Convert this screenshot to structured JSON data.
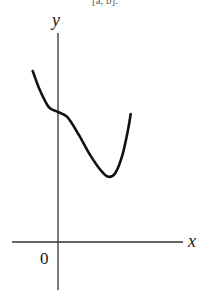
{
  "figure": {
    "top_fragment": "[a, b].",
    "axes": {
      "x_label": "x",
      "y_label": "y",
      "origin_label": "0"
    },
    "curve": {
      "description": "Continuous curve starting high at left, decreasing to a flat point on the y-axis, dipping to a local minimum, then rising again",
      "points": [
        [
          -0.55,
          1.0
        ],
        [
          -0.4,
          0.55
        ],
        [
          -0.2,
          0.12
        ],
        [
          0.0,
          0.0
        ],
        [
          0.2,
          -0.12
        ],
        [
          0.45,
          -0.55
        ],
        [
          0.7,
          -1.05
        ],
        [
          0.95,
          -1.45
        ],
        [
          1.1,
          -1.58
        ],
        [
          1.25,
          -1.48
        ],
        [
          1.4,
          -1.05
        ],
        [
          1.52,
          -0.45
        ],
        [
          1.58,
          -0.05
        ]
      ]
    },
    "colors": {
      "curve": "#111111",
      "axes": "#333333",
      "text": "#1a1a1a"
    }
  }
}
